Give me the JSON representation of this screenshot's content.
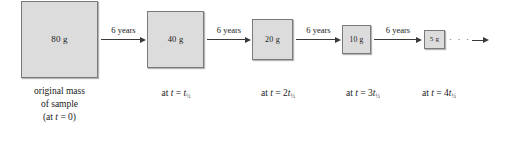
{
  "figure": {
    "box_fill_color": "#dcdcdc",
    "box_border_color": "#7a7a7a",
    "arrow_color": "#3a3a3a",
    "background_color": "#ffffff"
  },
  "boxes": [
    {
      "mass": "80 g"
    },
    {
      "mass": "40 g"
    },
    {
      "mass": "20 g"
    },
    {
      "mass": "10 g"
    },
    {
      "mass": "5 g"
    }
  ],
  "arrows": [
    {
      "label": "6 years"
    },
    {
      "label": "6 years"
    },
    {
      "label": "6 years"
    },
    {
      "label": "6 years"
    }
  ],
  "tail": {
    "ellipsis": "· · ·"
  },
  "captions": {
    "main": {
      "line1": "original mass",
      "line2": "of sample",
      "line3_prefix": "(at ",
      "line3_var": "t",
      "line3_suffix": " = 0)"
    },
    "times": [
      {
        "prefix": "at ",
        "var": "t",
        "eq": " = ",
        "coeff": "",
        "sym": "t",
        "sub": "½"
      },
      {
        "prefix": "at ",
        "var": "t",
        "eq": " = ",
        "coeff": "2",
        "sym": "t",
        "sub": "½"
      },
      {
        "prefix": "at ",
        "var": "t",
        "eq": " = ",
        "coeff": "3",
        "sym": "t",
        "sub": "½"
      },
      {
        "prefix": "at ",
        "var": "t",
        "eq": " = ",
        "coeff": "4",
        "sym": "t",
        "sub": "½"
      }
    ]
  }
}
